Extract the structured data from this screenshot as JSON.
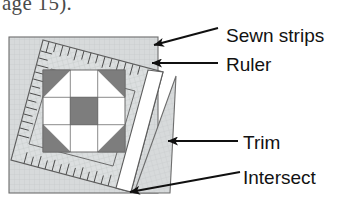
{
  "figure": {
    "cropped_text_above": "age 15).",
    "diagram_type": "quilting instruction diagram",
    "callouts": [
      {
        "id": "sewn-strips",
        "label": "Sewn strips",
        "arrow": "arrow-left-icon"
      },
      {
        "id": "ruler",
        "label": "Ruler",
        "arrow": "arrow-left-icon"
      },
      {
        "id": "trim",
        "label": "Trim",
        "arrow": "arrow-left-icon"
      },
      {
        "id": "intersect",
        "label": "Intersect",
        "arrow": "arrow-left-icon"
      }
    ],
    "colors": {
      "fabric_light": "#d7dadb",
      "fabric_light_line": "#c3c8c9",
      "patch_gray": "#7d7d7d",
      "patch_white": "#ffffff",
      "outline": "#5a5a5a",
      "ruler_face": "#ffffff",
      "ruler_tick": "#4d4d4d",
      "arrow": "#101010",
      "label_text": "#121212",
      "page_background": "#ffffff"
    },
    "block": {
      "name": "nine-patch-with-corner-triangles",
      "grid": "3x3",
      "cells": [
        [
          "corner-triangle-gray",
          "white",
          "corner-triangle-gray"
        ],
        [
          "white",
          "gray",
          "white"
        ],
        [
          "corner-triangle-gray",
          "white",
          "corner-triangle-gray"
        ]
      ]
    },
    "ruler": {
      "name": "quilting-ruler",
      "tick_count_top": 14,
      "tick_count_left": 13,
      "tick_count_bottom": 13,
      "tick_count_right": 11
    }
  }
}
